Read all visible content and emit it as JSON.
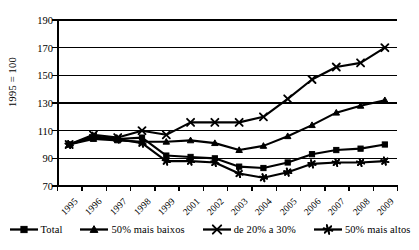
{
  "chart_data": {
    "type": "line",
    "title": "",
    "xlabel": "",
    "ylabel": "1995 = 100",
    "ylim": [
      70,
      190
    ],
    "yticks": [
      70,
      90,
      110,
      130,
      150,
      170,
      190
    ],
    "grid": true,
    "legend_position": "bottom",
    "categories": [
      "1995",
      "1996",
      "1997",
      "1998",
      "1999",
      "2001",
      "2002",
      "2003",
      "2004",
      "2005",
      "2006",
      "2007",
      "2008",
      "2009"
    ],
    "series": [
      {
        "name": "Total",
        "marker": "square",
        "values": [
          100,
          105,
          104,
          105,
          92,
          91,
          90,
          84,
          83,
          87,
          93,
          96,
          97,
          100
        ]
      },
      {
        "name": "50% mais baixos",
        "marker": "triangle",
        "values": [
          100,
          104,
          103,
          102,
          102,
          103,
          101,
          96,
          99,
          106,
          114,
          123,
          128,
          132
        ]
      },
      {
        "name": "de 20% a 30%",
        "marker": "x",
        "values": [
          100,
          107,
          105,
          110,
          107,
          116,
          116,
          116,
          120,
          133,
          147,
          156,
          159,
          170
        ]
      },
      {
        "name": "50% mais altos",
        "marker": "asterisk",
        "values": [
          100,
          106,
          104,
          101,
          88,
          88,
          87,
          79,
          76,
          80,
          86,
          87,
          87,
          88
        ]
      }
    ]
  },
  "legend": {
    "items": [
      {
        "label": "Total",
        "marker": "square-marker-icon"
      },
      {
        "label": "50% mais baixos",
        "marker": "triangle-marker-icon"
      },
      {
        "label": "de 20% a 30%",
        "marker": "x-marker-icon"
      },
      {
        "label": "50% mais altos",
        "marker": "asterisk-marker-icon"
      }
    ]
  },
  "footer": {
    "source_sliver": ""
  }
}
